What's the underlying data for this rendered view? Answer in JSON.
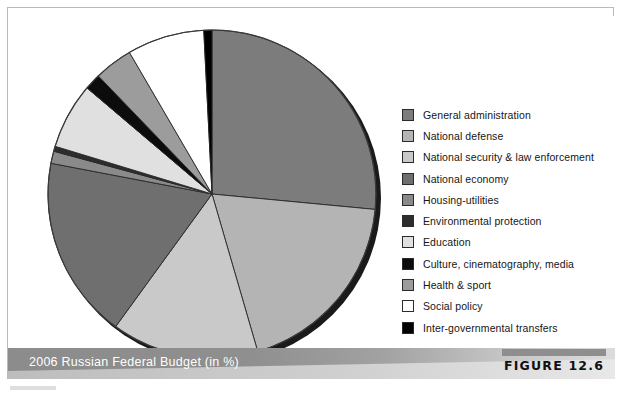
{
  "figure": {
    "caption": "2006 Russian Federal Budget (in %)",
    "tag": "FIGURE 12.6"
  },
  "legend": {
    "items": [
      {
        "label": "General administration",
        "color": "#7c7c7c"
      },
      {
        "label": "National defense",
        "color": "#b4b4b4"
      },
      {
        "label": "National security & law enforcement",
        "color": "#c9c9c9"
      },
      {
        "label": "National economy",
        "color": "#6f6f6f"
      },
      {
        "label": "Housing-utilities",
        "color": "#8a8a8a"
      },
      {
        "label": "Environmental protection",
        "color": "#2d2d2d"
      },
      {
        "label": "Education",
        "color": "#e0e0e0"
      },
      {
        "label": "Culture, cinematography, media",
        "color": "#0c0c0c"
      },
      {
        "label": "Health & sport",
        "color": "#9c9c9c"
      },
      {
        "label": "Social policy",
        "color": "#ffffff"
      },
      {
        "label": "Inter-governmental transfers",
        "color": "#000000"
      }
    ]
  },
  "chart_data": {
    "type": "pie",
    "title": "2006 Russian Federal Budget (in %)",
    "unit": "%",
    "start_angle_deg": 0,
    "direction": "clockwise",
    "center": {
      "x": 176,
      "y": 172
    },
    "radius": 164,
    "labels": [
      "General administration",
      "National defense",
      "National security & law enforcement",
      "National economy",
      "Housing-utilities",
      "Environmental protection",
      "Education",
      "Culture, cinematography, media",
      "Health & sport",
      "Social policy",
      "Inter-governmental transfers"
    ],
    "values": [
      26.5,
      19.0,
      14.5,
      18.0,
      1.2,
      0.5,
      6.5,
      1.6,
      3.8,
      7.6,
      0.8
    ],
    "colors": [
      "#7c7c7c",
      "#b4b4b4",
      "#c9c9c9",
      "#6f6f6f",
      "#8a8a8a",
      "#2d2d2d",
      "#e0e0e0",
      "#0c0c0c",
      "#9c9c9c",
      "#ffffff",
      "#000000"
    ],
    "legend_position": "right",
    "grid": false,
    "data_labels_shown": false
  }
}
